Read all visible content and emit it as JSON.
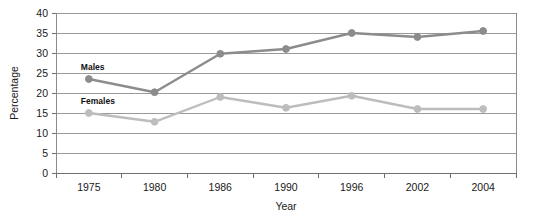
{
  "chart_data": {
    "type": "line",
    "title": "",
    "xlabel": "Year",
    "ylabel": "Percentage",
    "categories": [
      "1975",
      "1980",
      "1986",
      "1990",
      "1996",
      "2002",
      "2004"
    ],
    "series": [
      {
        "name": "Males",
        "color": "#8c8c8c",
        "values": [
          23.5,
          20.2,
          29.8,
          31.0,
          35.0,
          34.0,
          35.5
        ]
      },
      {
        "name": "Females",
        "color": "#bdbdbd",
        "values": [
          15.0,
          12.8,
          19.0,
          16.3,
          19.3,
          16.0,
          16.0
        ]
      }
    ],
    "ylim": [
      0,
      40
    ],
    "yticks": [
      0,
      5,
      10,
      15,
      20,
      25,
      30,
      35,
      40
    ],
    "ytick_labels": [
      "0",
      "5",
      "10",
      "15",
      "20",
      "25",
      "30",
      "35",
      "40"
    ],
    "grid": true,
    "grid_color": "#9a9a9a",
    "legend": "inline-labels",
    "frame_color": "#9a9a9a",
    "axis_text_color": "#1a1a1a"
  },
  "labels": {
    "y_axis_title": "Percentage",
    "x_axis_title": "Year",
    "series_males": "Males",
    "series_females": "Females"
  },
  "ticks": {
    "y": [
      "40",
      "35",
      "30",
      "25",
      "20",
      "15",
      "10",
      "5",
      "0"
    ],
    "x": [
      "1975",
      "1980",
      "1986",
      "1990",
      "1996",
      "2002",
      "2004"
    ]
  }
}
